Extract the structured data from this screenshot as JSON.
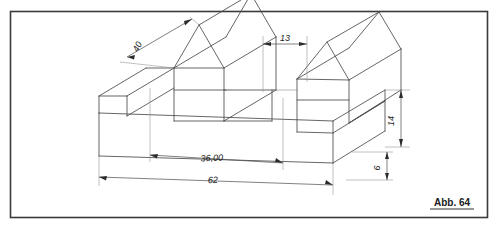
{
  "figure": {
    "type": "technical-drawing",
    "projection": "isometric",
    "caption": "Abb. 64",
    "caption_underlined": true,
    "border": {
      "present": true,
      "color": "#3a3a3a",
      "x": 10,
      "y": 11,
      "width": 478,
      "height": 207
    },
    "line_color": "#4a4a4a",
    "background": "#ffffff"
  },
  "dimensions": [
    {
      "id": "dim-40",
      "label": "40",
      "orientation": "oblique-up-right",
      "rotation_deg": -63,
      "text_x": 140,
      "text_y": 48
    },
    {
      "id": "dim-13",
      "label": "13",
      "orientation": "horizontal",
      "rotation_deg": 0,
      "text_x": 285,
      "text_y": 41
    },
    {
      "id": "dim-36",
      "label": "36,00",
      "orientation": "oblique-right",
      "rotation_deg": -5,
      "text_x": 212,
      "text_y": 161
    },
    {
      "id": "dim-62",
      "label": "62",
      "orientation": "oblique-right",
      "rotation_deg": -5,
      "text_x": 213,
      "text_y": 183
    },
    {
      "id": "dim-14",
      "label": "14",
      "orientation": "vertical",
      "rotation_deg": -90,
      "text_x": 394,
      "text_y": 128
    },
    {
      "id": "dim-6",
      "label": "6",
      "orientation": "vertical",
      "rotation_deg": -90,
      "text_x": 380,
      "text_y": 166
    }
  ],
  "geometry": {
    "description": "Stepped isometric solid with two triangular-prism (roof) features on a rectangular base plate",
    "features": [
      "base-plate",
      "left-roof-prism",
      "left-step",
      "center-channel",
      "right-roof-prism",
      "right-step"
    ]
  }
}
